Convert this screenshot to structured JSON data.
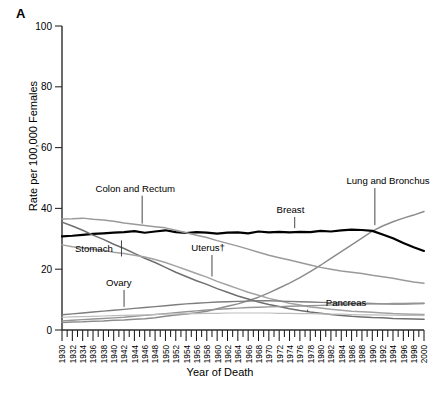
{
  "figure": {
    "panel_label": "A",
    "xlabel": "Year of Death",
    "ylabel": "Rate per 100,000 Females"
  },
  "chart_data": {
    "type": "line",
    "title": "",
    "subtitle": "",
    "xlabel": "Year of Death",
    "ylabel": "Rate per 100,000 Females",
    "xlim": [
      1930,
      2000
    ],
    "ylim": [
      0,
      100
    ],
    "yticks": [
      0,
      20,
      40,
      60,
      80,
      100
    ],
    "xticks": [
      1930,
      1932,
      1934,
      1936,
      1938,
      1940,
      1942,
      1944,
      1946,
      1948,
      1950,
      1952,
      1954,
      1956,
      1958,
      1960,
      1962,
      1964,
      1966,
      1968,
      1970,
      1972,
      1974,
      1976,
      1978,
      1980,
      1982,
      1984,
      1986,
      1988,
      1990,
      1992,
      1994,
      1996,
      1998,
      2000
    ],
    "xtick_labels": [
      "1930",
      "1932",
      "1934",
      "1936",
      "1938",
      "1940",
      "1942",
      "1944",
      "1946",
      "1948",
      "1950",
      "1952",
      "1954",
      "1956",
      "1958",
      "1960",
      "1962",
      "1964",
      "1966",
      "1968",
      "1970",
      "1972",
      "1974",
      "1976",
      "1978",
      "1980",
      "1982",
      "1984",
      "1986",
      "1988",
      "1990",
      "1992",
      "1994",
      "1996",
      "1998",
      "2000"
    ],
    "grid": false,
    "legend_position": "inline-annotations",
    "x": [
      1930,
      1932,
      1934,
      1936,
      1938,
      1940,
      1942,
      1944,
      1946,
      1948,
      1950,
      1952,
      1954,
      1956,
      1958,
      1960,
      1962,
      1964,
      1966,
      1968,
      1970,
      1972,
      1974,
      1976,
      1978,
      1980,
      1982,
      1984,
      1986,
      1988,
      1990,
      1992,
      1994,
      1996,
      1998,
      2000
    ],
    "series": [
      {
        "name": "Lung and Bronchus",
        "color": "#8c8c8c",
        "width": 1.5,
        "values": [
          2.5,
          2.6,
          2.7,
          2.9,
          3.0,
          3.2,
          3.3,
          3.5,
          3.7,
          4.0,
          4.5,
          4.9,
          5.3,
          5.7,
          6.2,
          7.0,
          7.8,
          8.6,
          9.6,
          10.8,
          12.2,
          13.8,
          15.4,
          17.2,
          19.2,
          21.3,
          23.6,
          25.8,
          28.0,
          30.2,
          32.5,
          34.2,
          35.6,
          36.8,
          37.8,
          39.0
        ]
      },
      {
        "name": "Breast",
        "color": "#000000",
        "width": 2.2,
        "values": [
          30.8,
          31.0,
          31.3,
          31.6,
          31.8,
          32.0,
          32.2,
          32.5,
          32.0,
          32.4,
          32.8,
          32.2,
          31.9,
          32.2,
          32.0,
          31.7,
          32.0,
          32.1,
          31.8,
          32.4,
          32.1,
          32.3,
          32.1,
          32.3,
          32.2,
          32.6,
          32.4,
          32.8,
          33.0,
          32.9,
          32.6,
          31.4,
          30.2,
          28.6,
          27.2,
          26.0
        ]
      },
      {
        "name": "Colon and Rectum",
        "color": "#9a9a9a",
        "width": 1.5,
        "values": [
          36.5,
          36.6,
          36.8,
          36.4,
          36.2,
          35.8,
          35.2,
          34.8,
          34.4,
          34.0,
          33.6,
          32.8,
          32.0,
          31.2,
          30.4,
          29.4,
          28.5,
          27.6,
          26.6,
          25.6,
          24.6,
          23.8,
          23.0,
          22.2,
          21.4,
          20.6,
          20.0,
          19.4,
          19.0,
          18.6,
          18.0,
          17.5,
          17.0,
          16.4,
          15.8,
          15.4
        ]
      },
      {
        "name": "Stomach",
        "color": "#6f6f6f",
        "width": 1.5,
        "values": [
          35.5,
          34.2,
          32.8,
          31.2,
          29.8,
          28.2,
          26.8,
          25.2,
          23.6,
          22.2,
          20.6,
          19.0,
          17.6,
          16.2,
          15.0,
          13.6,
          12.4,
          11.2,
          10.2,
          9.2,
          8.4,
          7.7,
          7.0,
          6.4,
          5.9,
          5.5,
          5.1,
          4.8,
          4.5,
          4.3,
          4.1,
          4.0,
          3.8,
          3.7,
          3.6,
          3.5
        ]
      },
      {
        "name": "Uterus",
        "label": "Uterus†",
        "color": "#a2a2a2",
        "width": 1.5,
        "values": [
          28.0,
          27.4,
          27.0,
          26.6,
          26.2,
          25.6,
          25.2,
          24.6,
          24.0,
          23.2,
          22.2,
          21.0,
          19.8,
          18.6,
          17.4,
          16.0,
          14.8,
          13.6,
          12.4,
          11.4,
          10.4,
          9.6,
          8.8,
          8.2,
          7.6,
          7.2,
          6.8,
          6.5,
          6.2,
          6.0,
          5.8,
          5.6,
          5.4,
          5.3,
          5.2,
          5.1
        ]
      },
      {
        "name": "Ovary",
        "color": "#7d7d7d",
        "width": 1.4,
        "values": [
          5.0,
          5.3,
          5.6,
          5.9,
          6.2,
          6.5,
          6.8,
          7.1,
          7.4,
          7.7,
          8.0,
          8.3,
          8.6,
          8.8,
          9.0,
          9.2,
          9.3,
          9.4,
          9.5,
          9.6,
          9.6,
          9.5,
          9.4,
          9.3,
          9.2,
          9.1,
          9.0,
          8.9,
          8.8,
          8.8,
          8.7,
          8.6,
          8.5,
          8.5,
          8.6,
          8.7
        ]
      },
      {
        "name": "Pancreas",
        "color": "#959595",
        "width": 1.4,
        "values": [
          3.0,
          3.2,
          3.4,
          3.6,
          3.8,
          4.0,
          4.2,
          4.5,
          4.8,
          5.1,
          5.4,
          5.7,
          6.0,
          6.3,
          6.6,
          6.8,
          7.0,
          7.2,
          7.4,
          7.5,
          7.6,
          7.7,
          7.8,
          7.9,
          8.0,
          8.1,
          8.2,
          8.3,
          8.4,
          8.5,
          8.6,
          8.6,
          8.7,
          8.7,
          8.8,
          8.8
        ]
      },
      {
        "name": "Lower series C",
        "color": "#bdbdbd",
        "width": 1.2,
        "values": [
          4.2,
          4.3,
          4.4,
          4.5,
          4.6,
          4.7,
          4.8,
          4.9,
          5.0,
          5.1,
          5.2,
          5.3,
          5.4,
          5.4,
          5.5,
          5.5,
          5.6,
          5.6,
          5.6,
          5.6,
          5.6,
          5.5,
          5.5,
          5.4,
          5.4,
          5.3,
          5.2,
          5.2,
          5.1,
          5.0,
          5.0,
          4.9,
          4.9,
          4.8,
          4.8,
          4.7
        ]
      }
    ],
    "annotations": [
      {
        "name": "colon-and-rectum",
        "text": "Colon and Rectum",
        "x": 1936.5,
        "y": 45.5,
        "anchor": "start",
        "leader_to": {
          "x": 1945.5,
          "y": 35.0
        }
      },
      {
        "name": "stomach",
        "text": "Stomach",
        "x": 1932.5,
        "y": 25.5,
        "anchor": "start",
        "leader_to": {
          "x": 1941.5,
          "y": 29.5
        }
      },
      {
        "name": "ovary",
        "text": "Ovary",
        "x": 1938.5,
        "y": 14.5,
        "anchor": "start",
        "leader_to": {
          "x": 1942.0,
          "y": 7.6
        }
      },
      {
        "name": "uterus",
        "text": "Uterus†",
        "x": 1955.0,
        "y": 26.0,
        "anchor": "start",
        "leader_to": {
          "x": 1959.0,
          "y": 17.6
        }
      },
      {
        "name": "breast",
        "text": "Breast",
        "x": 1971.5,
        "y": 38.5,
        "anchor": "start",
        "leader_to": {
          "x": 1975.0,
          "y": 33.5
        }
      },
      {
        "name": "lung-and-bronchus",
        "text": "Lung and Bronchus",
        "x": 1985.0,
        "y": 48.0,
        "anchor": "start",
        "leader_to": {
          "x": 1990.5,
          "y": 34.5
        }
      },
      {
        "name": "pancreas",
        "text": "Pancreas",
        "x": 1981.0,
        "y": 8.0,
        "anchor": "start",
        "leader_to": {
          "x": 1977.5,
          "y": 6.0
        }
      }
    ]
  }
}
